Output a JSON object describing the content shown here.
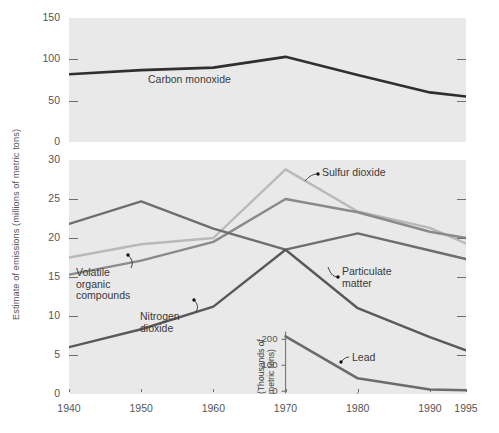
{
  "figure": {
    "y_axis_title": "Estimate of emissions (millions of metric tons)"
  },
  "x_axis": {
    "ticks": [
      "1940",
      "1950",
      "1960",
      "1970",
      "1980",
      "1990",
      "1995"
    ],
    "values": [
      1940,
      1950,
      1960,
      1970,
      1980,
      1990,
      1995
    ],
    "range": [
      1940,
      1995
    ]
  },
  "top_panel": {
    "y_ticks": [
      "0",
      "50",
      "100",
      "150"
    ],
    "y_values": [
      0,
      50,
      100,
      150
    ],
    "ylim": [
      0,
      150
    ],
    "label": "Carbon monoxide"
  },
  "bottom_panel": {
    "y_ticks": [
      "0",
      "5",
      "10",
      "15",
      "20",
      "25",
      "30"
    ],
    "y_values": [
      0,
      5,
      10,
      15,
      20,
      25,
      30
    ],
    "ylim": [
      0,
      30
    ],
    "labels": {
      "sulfur_dioxide": "Sulfur dioxide",
      "particulate_matter": "Particulate matter",
      "particulate_matter_line1": "Particulate",
      "particulate_matter_line2": "matter",
      "voc_line1": "Volatile",
      "voc_line2": "organic",
      "voc_line3": "compounds",
      "nitrogen_dioxide_line1": "Nitrogen",
      "nitrogen_dioxide_line2": "dioxide"
    }
  },
  "inset": {
    "y_axis_title_line1": "(Thousands of",
    "y_axis_title_line2": "metric tons)",
    "y_ticks": [
      "0",
      "100",
      "200"
    ],
    "y_values": [
      0,
      100,
      200
    ],
    "ylim": [
      0,
      230
    ],
    "xlim": [
      1970,
      1995
    ],
    "label": "Lead"
  },
  "colors": {
    "panel_background": "#e9e9e9",
    "page_background": "#ffffff",
    "carbon_monoxide": "#2f2f2f",
    "sulfur_dioxide": "#b9b9b9",
    "particulate_matter": "#8a8a8a",
    "volatile_organic_compounds": "#6e6e6e",
    "nitrogen_dioxide": "#595959",
    "lead": "#6b6b6b",
    "text": "#555555",
    "tick": "#6f6f6f"
  },
  "chart_data": {
    "type": "line",
    "title": "",
    "xlabel": "",
    "ylabel": "Estimate of emissions (millions of metric tons)",
    "x": [
      1940,
      1950,
      1960,
      1970,
      1980,
      1990,
      1995
    ],
    "panels": [
      {
        "name": "top",
        "ylabel": "Estimate of emissions (millions of metric tons)",
        "ylim": [
          0,
          150
        ],
        "yticks": [
          0,
          50,
          100,
          150
        ],
        "grid": false,
        "series": [
          {
            "name": "Carbon monoxide",
            "color": "#2f2f2f",
            "x": [
              1940,
              1950,
              1960,
              1970,
              1980,
              1990,
              1995
            ],
            "values": [
              82,
              87,
              90,
              103,
              81,
              60,
              55
            ]
          }
        ]
      },
      {
        "name": "bottom",
        "ylabel": "Estimate of emissions (millions of metric tons)",
        "ylim": [
          0,
          30
        ],
        "yticks": [
          0,
          5,
          10,
          15,
          20,
          25,
          30
        ],
        "grid": false,
        "series": [
          {
            "name": "Sulfur dioxide",
            "color": "#b9b9b9",
            "x": [
              1940,
              1950,
              1960,
              1970,
              1980,
              1990,
              1995
            ],
            "values": [
              17.5,
              19.2,
              20.0,
              28.8,
              23.4,
              21.3,
              19.3
            ]
          },
          {
            "name": "Particulate matter",
            "color": "#8a8a8a",
            "x": [
              1940,
              1950,
              1960,
              1970,
              1980,
              1990,
              1995
            ],
            "values": [
              15.3,
              17.1,
              19.5,
              25.0,
              23.3,
              20.8,
              20.0
            ]
          },
          {
            "name": "Volatile organic compounds",
            "color": "#6e6e6e",
            "x": [
              1940,
              1950,
              1960,
              1970,
              1980,
              1990,
              1995
            ],
            "values": [
              21.8,
              24.7,
              21.2,
              18.5,
              20.6,
              18.4,
              17.3
            ]
          },
          {
            "name": "Nitrogen dioxide",
            "color": "#595959",
            "x": [
              1940,
              1950,
              1960,
              1970,
              1980,
              1990,
              1995
            ],
            "values": [
              6.0,
              8.3,
              11.2,
              18.5,
              11.0,
              7.3,
              5.6
            ]
          }
        ]
      },
      {
        "name": "inset",
        "ylabel": "(Thousands of metric tons)",
        "ylim": [
          0,
          230
        ],
        "yticks": [
          0,
          100,
          200
        ],
        "xlim": [
          1970,
          1995
        ],
        "grid": false,
        "series": [
          {
            "name": "Lead",
            "color": "#6b6b6b",
            "x": [
              1970,
              1980,
              1990,
              1995
            ],
            "values": [
              212,
              50,
              7,
              4
            ]
          }
        ]
      }
    ]
  }
}
